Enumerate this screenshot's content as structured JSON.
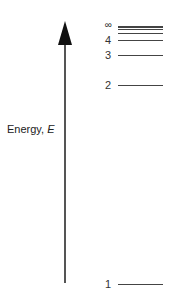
{
  "diagram": {
    "axis": {
      "label": "Energy, ",
      "symbol": "E"
    },
    "levels": [
      {
        "n": "∞",
        "y": 26
      },
      {
        "n": "",
        "y": 28
      },
      {
        "n": "",
        "y": 33
      },
      {
        "n": "4",
        "y": 40
      },
      {
        "n": "3",
        "y": 55
      },
      {
        "n": "2",
        "y": 85
      },
      {
        "n": "1",
        "y": 284
      }
    ]
  }
}
